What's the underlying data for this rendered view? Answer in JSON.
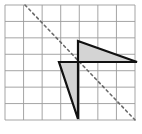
{
  "figure": {
    "type": "geometry-diagram",
    "canvas": {
      "width": 142,
      "height": 134,
      "background": "#ffffff"
    },
    "grid": {
      "name": "square-grid",
      "columns": 7,
      "rows": 7,
      "x0": 5,
      "y0": 5,
      "x1": 135,
      "y1": 120,
      "cell_width": 18.57,
      "cell_height": 16.43,
      "line_color": "#9b9b9b",
      "line_width": 0.9,
      "border_color": "#9b9b9b",
      "visible": true
    },
    "reflection_line": {
      "name": "line-of-reflection",
      "style": "dashed",
      "color": "#6b6b6b",
      "width": 1.6,
      "dash_pattern": "2.4 3.2",
      "x1": 25,
      "y1": 5,
      "x2": 136,
      "y2": 121
    },
    "shapes": [
      {
        "name": "upper-triangle",
        "label": "image triangle (above the line)",
        "fill": "#d4d4d4",
        "stroke": "#111111",
        "stroke_width": 2.2,
        "points": "78,41 137,62 78,62"
      },
      {
        "name": "lower-triangle",
        "label": "pre-image triangle (below the line)",
        "fill": "#d4d4d4",
        "stroke": "#111111",
        "stroke_width": 2.2,
        "points": "78,62 78,119 59,62"
      }
    ]
  }
}
